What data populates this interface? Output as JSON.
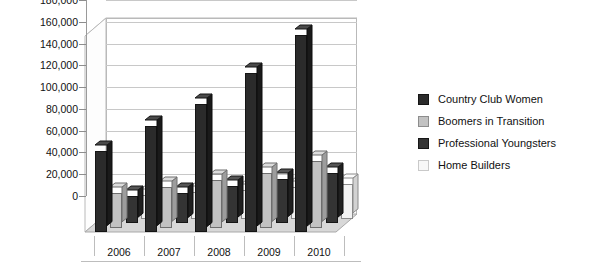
{
  "chart_data": {
    "type": "bar",
    "title": "",
    "xlabel": "",
    "ylabel": "",
    "categories": [
      "2006",
      "2007",
      "2008",
      "2009",
      "2010"
    ],
    "ylim": [
      0,
      180000
    ],
    "yticks": [
      0,
      20000,
      40000,
      60000,
      80000,
      100000,
      120000,
      140000,
      160000,
      180000
    ],
    "ytick_labels": [
      "0",
      "20,000",
      "40,000",
      "60,000",
      "80,000",
      "100,000",
      "120,000",
      "140,000",
      "160,000",
      "180,000"
    ],
    "grid": true,
    "legend_position": "right",
    "three_d": true,
    "series": [
      {
        "name": "Country Club Women",
        "color": "#2b2b2b",
        "values": [
          74000,
          97000,
          118000,
          146000,
          181000
        ]
      },
      {
        "name": "Boomers in Transition",
        "color": "#c2c2c2",
        "values": [
          32000,
          37000,
          44000,
          50000,
          61000
        ]
      },
      {
        "name": "Professional Youngsters",
        "color": "#343434",
        "values": [
          25000,
          28000,
          34000,
          40000,
          46000
        ]
      },
      {
        "name": "Home Builders",
        "color": "#f2f2f2",
        "values": [
          22000,
          24000,
          26000,
          29000,
          32000
        ]
      }
    ]
  },
  "legend": {
    "items": [
      {
        "label": "Country Club Women"
      },
      {
        "label": "Boomers in Transition"
      },
      {
        "label": "Professional Youngsters"
      },
      {
        "label": "Home Builders"
      }
    ]
  }
}
